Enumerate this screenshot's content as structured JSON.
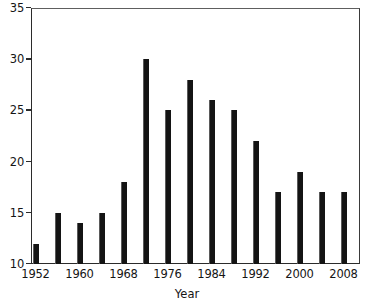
{
  "chart_data": {
    "type": "bar",
    "title": "",
    "subtitle": "",
    "xlabel": "Year",
    "ylabel": "",
    "categories": [
      1952,
      1956,
      1960,
      1964,
      1968,
      1972,
      1976,
      1980,
      1984,
      1988,
      1992,
      1996,
      2000,
      2004,
      2008
    ],
    "values": [
      12,
      15,
      14,
      15,
      18,
      30,
      25,
      28,
      26,
      25,
      22,
      17,
      19,
      17,
      17
    ],
    "xlim": [
      1950,
      2010
    ],
    "ylim": [
      10,
      35
    ],
    "x_tick_labels": [
      "1952",
      "1960",
      "1968",
      "1976",
      "1984",
      "1992",
      "2000",
      "2008"
    ],
    "x_tick_values": [
      1952,
      1960,
      1968,
      1976,
      1984,
      1992,
      2000,
      2008
    ],
    "y_tick_labels": [
      "10",
      "15",
      "20",
      "25",
      "30",
      "35"
    ],
    "y_tick_values": [
      10,
      15,
      20,
      25,
      30,
      35
    ],
    "grid": false,
    "legend": null,
    "legend_position": "none",
    "bar_color": "#141414",
    "axis_color": "#2b2b2b",
    "background_color": "#ffffff",
    "annotations": []
  }
}
